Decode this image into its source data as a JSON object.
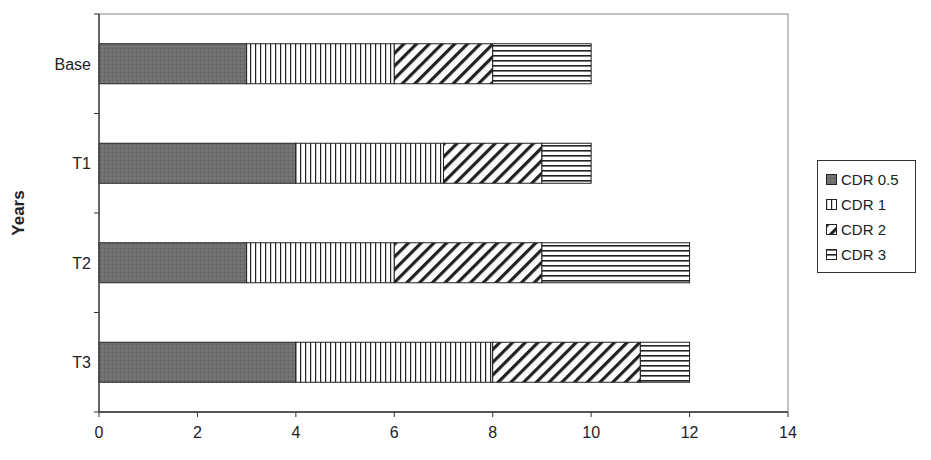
{
  "chart_data": {
    "type": "bar",
    "orientation": "horizontal",
    "stacked": true,
    "title": "",
    "xlabel": "",
    "ylabel": "Years",
    "categories": [
      "Base",
      "T1",
      "T2",
      "T3"
    ],
    "series": [
      {
        "name": "CDR 0.5",
        "pattern": "solid-gray",
        "values": [
          3,
          4,
          3,
          4
        ]
      },
      {
        "name": "CDR 1",
        "pattern": "vertical-lines",
        "values": [
          3,
          3,
          3,
          4
        ]
      },
      {
        "name": "CDR 2",
        "pattern": "diagonal-lines",
        "values": [
          2,
          2,
          3,
          3
        ]
      },
      {
        "name": "CDR 3",
        "pattern": "horizontal-lines",
        "values": [
          2,
          1,
          3,
          1
        ]
      }
    ],
    "xlim": [
      0,
      14
    ],
    "xticks": [
      0,
      2,
      4,
      6,
      8,
      10,
      12,
      14
    ],
    "grid": false,
    "legend_position": "right"
  },
  "colors": {
    "solid": "#6e6e6e",
    "line": "#222222",
    "axis": "#444444"
  }
}
